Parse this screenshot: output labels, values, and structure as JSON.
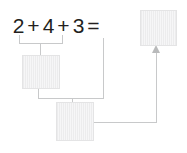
{
  "diagram": {
    "equation": {
      "full_text": "2 + 4 + 3 =",
      "tokens": [
        {
          "text": "2",
          "kind": "number"
        },
        {
          "text": "+",
          "kind": "operator"
        },
        {
          "text": "4",
          "kind": "number"
        },
        {
          "text": "+",
          "kind": "operator"
        },
        {
          "text": "3",
          "kind": "number"
        },
        {
          "text": "=",
          "kind": "operator"
        }
      ],
      "addends": [
        2,
        4,
        3
      ],
      "sum": 9
    },
    "blanks": [
      {
        "id": "answer",
        "label": "",
        "role": "final-answer-box",
        "placeholder": ""
      },
      {
        "id": "partial-1",
        "label": "",
        "role": "partial-sum-box-2-plus-4",
        "placeholder": ""
      },
      {
        "id": "partial-2",
        "label": "",
        "role": "partial-sum-box-plus-3",
        "placeholder": ""
      }
    ],
    "connectors": [
      {
        "id": "bracket-2-4",
        "from": "2 + 4",
        "to": "partial-1"
      },
      {
        "id": "bracket-partial1-3",
        "from": "partial-1 + 3",
        "to": "partial-2"
      },
      {
        "id": "arrow-to-answer",
        "from": "partial-2",
        "to": "answer"
      }
    ],
    "colors": {
      "text": "#231f20",
      "box_fill": "#f0f0f1",
      "box_border": "#e4e4e5",
      "line": "#c8c9ca",
      "background": "#ffffff"
    }
  }
}
